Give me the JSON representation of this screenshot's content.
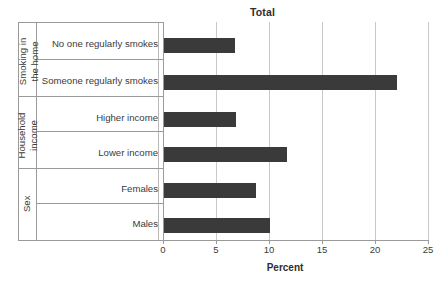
{
  "chart_data": {
    "type": "bar",
    "orientation": "horizontal",
    "title": "Total",
    "xlabel": "Percent",
    "ylabel": "",
    "xlim": [
      0,
      25
    ],
    "xticks": [
      "0",
      "5",
      "10",
      "15",
      "20",
      "25"
    ],
    "grid": true,
    "legend": null,
    "bar_color": "#3a3a3a",
    "groups": [
      {
        "group_label": "Smoking in the home",
        "group_label_lines": [
          "Smoking in",
          "the home"
        ],
        "categories": [
          "No one regularly smokes",
          "Someone regularly smokes"
        ],
        "values": [
          6.8,
          22.1
        ]
      },
      {
        "group_label": "Household income",
        "group_label_lines": [
          "Household",
          "income"
        ],
        "categories": [
          "Higher income",
          "Lower income"
        ],
        "values": [
          6.9,
          11.7
        ]
      },
      {
        "group_label": "Sex",
        "group_label_lines": [
          "Sex"
        ],
        "categories": [
          "Females",
          "Males"
        ],
        "values": [
          8.8,
          10.1
        ]
      }
    ],
    "categories": [
      "No one regularly smokes",
      "Someone regularly smokes",
      "Higher income",
      "Lower income",
      "Females",
      "Males"
    ],
    "values": [
      6.8,
      22.1,
      6.9,
      11.7,
      8.8,
      10.1
    ]
  },
  "labels": {
    "title": "Total",
    "x_axis_title": "Percent",
    "tick0": "0",
    "tick5": "5",
    "tick10": "10",
    "tick15": "15",
    "tick20": "20",
    "tick25": "25",
    "cat0": "No one regularly smokes",
    "cat1": "Someone regularly smokes",
    "cat2": "Higher income",
    "cat3": "Lower income",
    "cat4": "Females",
    "cat5": "Males",
    "group0_line1": "Smoking in",
    "group0_line2": "the home",
    "group1_line1": "Household",
    "group1_line2": "income",
    "group2_line1": "Sex"
  }
}
